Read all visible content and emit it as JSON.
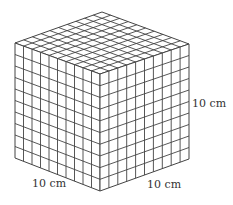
{
  "figure": {
    "divisions": 10,
    "line_color": "#444444",
    "fill_color": "#ffffff",
    "vertices": {
      "top_back": [
        102,
        12
      ],
      "top_left": [
        15,
        43
      ],
      "top_right": [
        189,
        44
      ],
      "top_front": [
        100,
        74
      ],
      "bottom_left": [
        15,
        158
      ],
      "bottom_right": [
        189,
        159
      ],
      "bottom_front": [
        100,
        191
      ]
    }
  },
  "labels": {
    "height": "10 cm",
    "left_width": "10 cm",
    "right_width": "10 cm"
  }
}
